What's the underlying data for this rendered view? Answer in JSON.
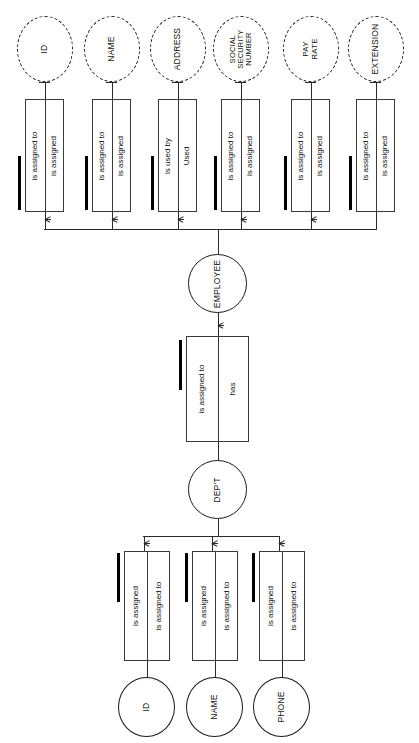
{
  "diagram": {
    "orientation": "rotated-90",
    "colors": {
      "line": "#2b2b2b",
      "box_border": "#3a3a3a",
      "bar": "#000000",
      "background": "#ffffff",
      "text": "#111111"
    }
  },
  "entities": {
    "employee": {
      "label": "EMPLOYEE",
      "style": "solid"
    },
    "dept": {
      "label": "DEP'T",
      "style": "solid"
    }
  },
  "employee_attributes": [
    {
      "label": "ID",
      "style": "dashed"
    },
    {
      "label": "NAME",
      "style": "dashed"
    },
    {
      "label": "ADDRESS",
      "style": "dashed"
    },
    {
      "label": "SOCIAL SECURITY NUMBER",
      "style": "dashed",
      "lines": [
        "SOCIAL",
        "SECURITY",
        "NUMBER"
      ]
    },
    {
      "label": "PAY RATE",
      "style": "dashed",
      "lines": [
        "PAY",
        "RATE"
      ]
    },
    {
      "label": "EXTENSION",
      "style": "dashed"
    }
  ],
  "dept_attributes": [
    {
      "label": "ID",
      "style": "solid"
    },
    {
      "label": "NAME",
      "style": "solid"
    },
    {
      "label": "PHONE",
      "style": "solid"
    }
  ],
  "employee_predicates": [
    {
      "near": "is assigned to",
      "far": "is assigned",
      "bar": true,
      "crowsfoot": true
    },
    {
      "near": "is assigned to",
      "far": "is assigned",
      "bar": true,
      "crowsfoot": true
    },
    {
      "near": "is used by",
      "far": "Used",
      "bar": true,
      "crowsfoot": true
    },
    {
      "near": "is assigned to",
      "far": "is assigned",
      "bar": true,
      "crowsfoot": true
    },
    {
      "near": "is assigned to",
      "far": "is assigned",
      "bar": true,
      "crowsfoot": true
    },
    {
      "near": "is assigned to",
      "far": "is assigned",
      "bar": true,
      "crowsfoot": false
    }
  ],
  "dept_predicates": [
    {
      "near": "is assigned",
      "far": "is assigned to",
      "bar": true,
      "crowsfoot": true
    },
    {
      "near": "is assigned",
      "far": "is assigned to",
      "bar": true,
      "crowsfoot": true
    },
    {
      "near": "is assigned",
      "far": "is assigned to",
      "bar": true,
      "crowsfoot": true
    }
  ],
  "center_predicate": {
    "near": "is assigned to",
    "far": "has",
    "bar": true,
    "crowsfoot": true
  }
}
